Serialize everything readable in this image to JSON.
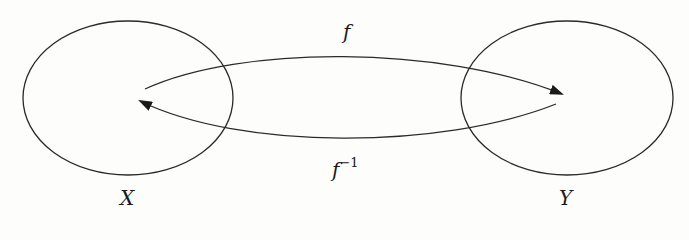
{
  "diagram": {
    "type": "function-mapping",
    "sets": [
      {
        "id": "X",
        "label": "X",
        "position": "left"
      },
      {
        "id": "Y",
        "label": "Y",
        "position": "right"
      }
    ],
    "arrows": [
      {
        "id": "f",
        "label": "f",
        "from": "X",
        "to": "Y",
        "direction": "upper"
      },
      {
        "id": "f_inverse",
        "label": "f",
        "superscript": "−1",
        "from": "Y",
        "to": "X",
        "direction": "lower"
      }
    ],
    "colors": {
      "stroke": "#2a2a2a",
      "background": "#fdfdfb"
    }
  }
}
